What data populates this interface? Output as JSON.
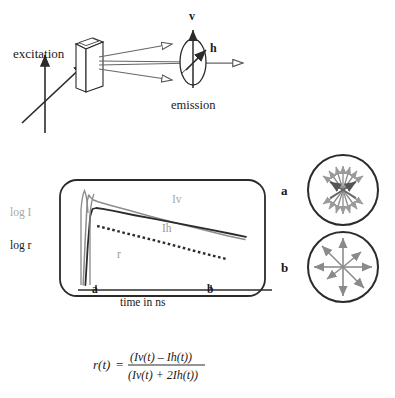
{
  "figure": {
    "background_color": "#ffffff",
    "width": 395,
    "height": 398
  },
  "apparatus": {
    "excitation_label": "excitation",
    "emission_label": "emission",
    "vertical_polarization_label": "v",
    "horizontal_polarization_label": "h",
    "sample_name": "sample-cuvette",
    "polarizer_name": "emission-polarizer"
  },
  "chart_data": {
    "type": "line",
    "title": "",
    "xlabel": "time in ns",
    "ylabel_intensity": "log I",
    "ylabel_anisotropy": "log r",
    "xtick_labels": [
      "a",
      "b"
    ],
    "xtick_positions": [
      0.12,
      0.72
    ],
    "grid": false,
    "legend_position": "inline",
    "xlim": [
      0,
      1
    ],
    "ylim": [
      0,
      1
    ],
    "series": [
      {
        "name": "Iv",
        "label": "Iv",
        "color": "#8c8c8c",
        "style": "solid",
        "x": [
          0.06,
          0.072,
          0.082,
          0.09,
          0.1,
          0.115,
          0.14,
          0.2,
          0.3,
          0.42,
          0.56,
          0.7,
          0.84,
          0.93
        ],
        "y": [
          0.03,
          0.52,
          0.87,
          0.93,
          0.905,
          0.88,
          0.862,
          0.83,
          0.78,
          0.718,
          0.65,
          0.585,
          0.52,
          0.485
        ]
      },
      {
        "name": "Ih",
        "label": "Ih",
        "color": "#2b2b2b",
        "style": "solid",
        "x": [
          0.072,
          0.085,
          0.098,
          0.11,
          0.13,
          0.165,
          0.23,
          0.33,
          0.45,
          0.59,
          0.73,
          0.86,
          0.935
        ],
        "y": [
          0.03,
          0.43,
          0.72,
          0.79,
          0.8,
          0.792,
          0.768,
          0.73,
          0.688,
          0.638,
          0.588,
          0.54,
          0.512
        ]
      },
      {
        "name": "r",
        "label": "r",
        "color": "#2b2b2b",
        "style": "dotted",
        "x": [
          0.135,
          0.2,
          0.28,
          0.36,
          0.44,
          0.52,
          0.6,
          0.68,
          0.76,
          0.83
        ],
        "y": [
          0.62,
          0.59,
          0.552,
          0.515,
          0.478,
          0.44,
          0.4,
          0.36,
          0.322,
          0.29
        ]
      }
    ]
  },
  "inset_diagrams": [
    {
      "id": "a",
      "label": "a",
      "name": "anisotropic-orientation-circle",
      "description": "bowtie arrangement of transition dipole arrows"
    },
    {
      "id": "b",
      "label": "b",
      "name": "isotropic-orientation-circle",
      "description": "radially symmetric arrangement of transition dipole arrows"
    }
  ],
  "equation": {
    "lhs": "r(t)",
    "equals": "=",
    "numerator": "(Iv(t) – Ih(t))",
    "denominator": "(Iv(t) + 2Ih(t))"
  }
}
